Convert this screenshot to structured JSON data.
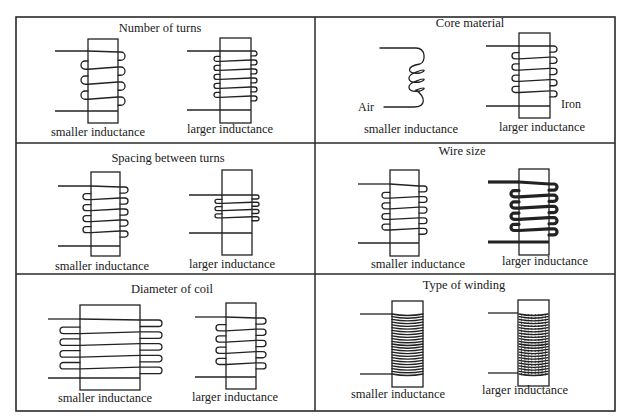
{
  "figure": {
    "frame": {
      "x": 16,
      "y": 17,
      "w": 599,
      "h": 394,
      "col_split": 315,
      "row_splits": [
        143,
        274
      ]
    },
    "panels": [
      {
        "id": "number-of-turns",
        "title": "Number of turns",
        "title_pos": [
          160,
          32
        ],
        "left": {
          "caption": "smaller inductance",
          "caption_pos": [
            98,
            136
          ],
          "core": [
            88,
            39,
            30,
            84
          ],
          "coil": {
            "turns": 4,
            "top": 52,
            "bottom": 112,
            "loop_out": 7,
            "lead_top": 51,
            "lead_bottom": 111,
            "lead_left": 55,
            "lead_right": 0
          }
        },
        "right": {
          "caption": "larger inductance",
          "caption_pos": [
            230,
            133
          ],
          "core": [
            220,
            38,
            31,
            85
          ],
          "coil": {
            "turns": 6,
            "top": 51,
            "bottom": 105,
            "loop_out": 6,
            "lead_top": 51,
            "lead_bottom": 110,
            "lead_left": 187,
            "lead_right": 0
          }
        }
      },
      {
        "id": "core-material",
        "title": "Core material",
        "title_pos": [
          470,
          27
        ],
        "left": {
          "caption": "smaller inductance",
          "caption_pos": [
            411,
            133
          ],
          "air_coil": {
            "x1": 380,
            "top": 48,
            "x2": 424,
            "bottom": 107,
            "loops": 3
          },
          "side_label": "Air",
          "side_label_pos": [
            372,
            111
          ]
        },
        "right": {
          "caption": "larger inductance",
          "caption_pos": [
            542,
            131
          ],
          "core": [
            519,
            33,
            31,
            85
          ],
          "coil": {
            "turns": 5,
            "top": 46,
            "bottom": 102,
            "loop_out": 7,
            "lead_top": 46,
            "lead_bottom": 106,
            "lead_left": 486,
            "lead_right": 0
          },
          "side_label": "Iron",
          "side_label_pos": [
            561,
            108
          ]
        }
      },
      {
        "id": "spacing-between-turns",
        "title": "Spacing between turns",
        "title_pos": [
          168,
          162
        ],
        "left": {
          "caption": "smaller inductance",
          "caption_pos": [
            102,
            270
          ],
          "core": [
            91,
            172,
            29,
            84
          ],
          "coil": {
            "turns": 5,
            "top": 187,
            "bottom": 242,
            "loop_out": 8,
            "lead_top": 186,
            "lead_bottom": 246,
            "lead_left": 58,
            "lead_right": 0
          }
        },
        "right": {
          "caption": "larger inductance",
          "caption_pos": [
            232,
            268
          ],
          "core": [
            222,
            170,
            30,
            85
          ],
          "coil": {
            "turns": 4,
            "top": 195,
            "bottom": 224,
            "loop_out": 7,
            "lead_top": 195,
            "lead_bottom": 233,
            "lead_left": 189,
            "lead_right": 0
          }
        }
      },
      {
        "id": "wire-size",
        "title": "Wire size",
        "title_pos": [
          462,
          155
        ],
        "left": {
          "caption": "smaller inductance",
          "caption_pos": [
            418,
            268
          ],
          "core": [
            390,
            170,
            29,
            86
          ],
          "coil": {
            "turns": 5,
            "top": 186,
            "bottom": 239,
            "loop_out": 8,
            "lead_top": 184,
            "lead_bottom": 243,
            "lead_left": 358,
            "lead_right": 0
          }
        },
        "right": {
          "caption": "larger inductance",
          "caption_pos": [
            545,
            265
          ],
          "core": [
            519,
            169,
            30,
            86
          ],
          "coil": {
            "turns": 5,
            "top": 184,
            "bottom": 240,
            "loop_out": 8,
            "lead_top": 182,
            "lead_bottom": 242,
            "lead_left": 488,
            "lead_right": 0,
            "thick": true
          }
        }
      },
      {
        "id": "diameter-of-coil",
        "title": "Diameter of coil",
        "title_pos": [
          172,
          293
        ],
        "left": {
          "caption": "smaller inductance",
          "caption_pos": [
            105,
            402
          ],
          "core": [
            80,
            305,
            60,
            85
          ],
          "coil": {
            "turns": 5,
            "top": 320,
            "bottom": 379,
            "loop_out": 22,
            "lead_top": 319,
            "lead_bottom": 378,
            "lead_left": 48,
            "lead_right": 0,
            "loop_in_out": 20
          }
        },
        "right": {
          "caption": "larger inductance",
          "caption_pos": [
            235,
            401
          ],
          "core": [
            226,
            303,
            30,
            86
          ],
          "coil": {
            "turns": 5,
            "top": 318,
            "bottom": 374,
            "loop_out": 10,
            "lead_top": 317,
            "lead_bottom": 377,
            "lead_left": 195,
            "lead_right": 0
          }
        }
      },
      {
        "id": "type-of-winding",
        "title": "Type of winding",
        "title_pos": [
          464,
          289
        ],
        "left": {
          "caption": "smaller inductance",
          "caption_pos": [
            398,
            398
          ],
          "core": [
            392,
            301,
            31,
            86
          ],
          "winding": {
            "type": "single-layer",
            "top": 314,
            "bottom": 374,
            "lines": 22
          },
          "lead_top": 314,
          "lead_bottom": 374,
          "lead_left": 360
        },
        "right": {
          "caption": "larger inductance",
          "caption_pos": [
            525,
            394
          ],
          "core": [
            518,
            300,
            31,
            86
          ],
          "winding": {
            "type": "multi-layer",
            "top": 314,
            "bottom": 374,
            "lines": 22
          },
          "lead_top": 313,
          "lead_bottom": 373,
          "lead_left": 488
        }
      }
    ]
  },
  "labels": {
    "number_of_turns": "Number of turns",
    "core_material": "Core material",
    "spacing_between_turns": "Spacing between turns",
    "wire_size": "Wire size",
    "diameter_of_coil": "Diameter of coil",
    "type_of_winding": "Type of winding",
    "smaller": "smaller inductance",
    "larger": "larger inductance",
    "air": "Air",
    "iron": "Iron"
  }
}
